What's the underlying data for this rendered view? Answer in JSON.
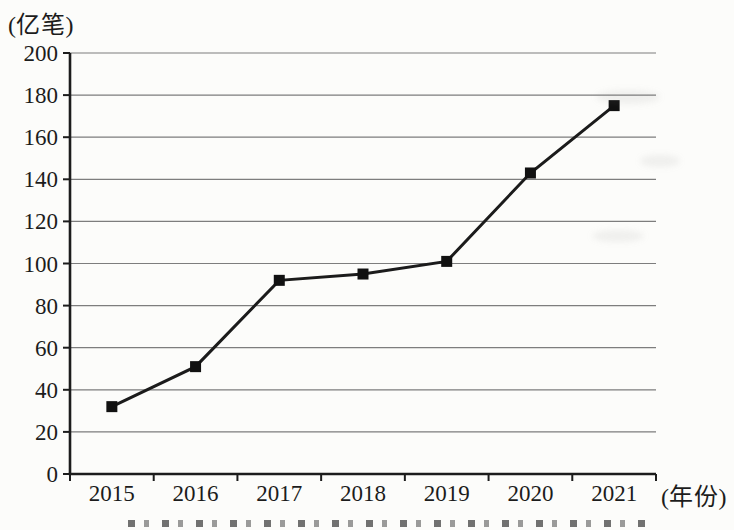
{
  "chart_data": {
    "type": "line",
    "title": "",
    "categories": [
      "2015",
      "2016",
      "2017",
      "2018",
      "2019",
      "2020",
      "2021"
    ],
    "values": [
      32,
      51,
      92,
      95,
      101,
      143,
      175
    ],
    "ylabel_unit": "(亿笔)",
    "xlabel_unit": "(年份)",
    "yticks": [
      0,
      20,
      40,
      60,
      80,
      100,
      120,
      140,
      160,
      180,
      200
    ],
    "ylim": [
      0,
      200
    ],
    "grid": true,
    "legend": "none",
    "marker": "filled-square",
    "colors": {
      "line": "#1b1b1b",
      "marker": "#111111",
      "grid": "#7d7d7d",
      "axis": "#1c1c1c",
      "text": "#1c1c1c",
      "background": "#fcfcfa"
    }
  }
}
